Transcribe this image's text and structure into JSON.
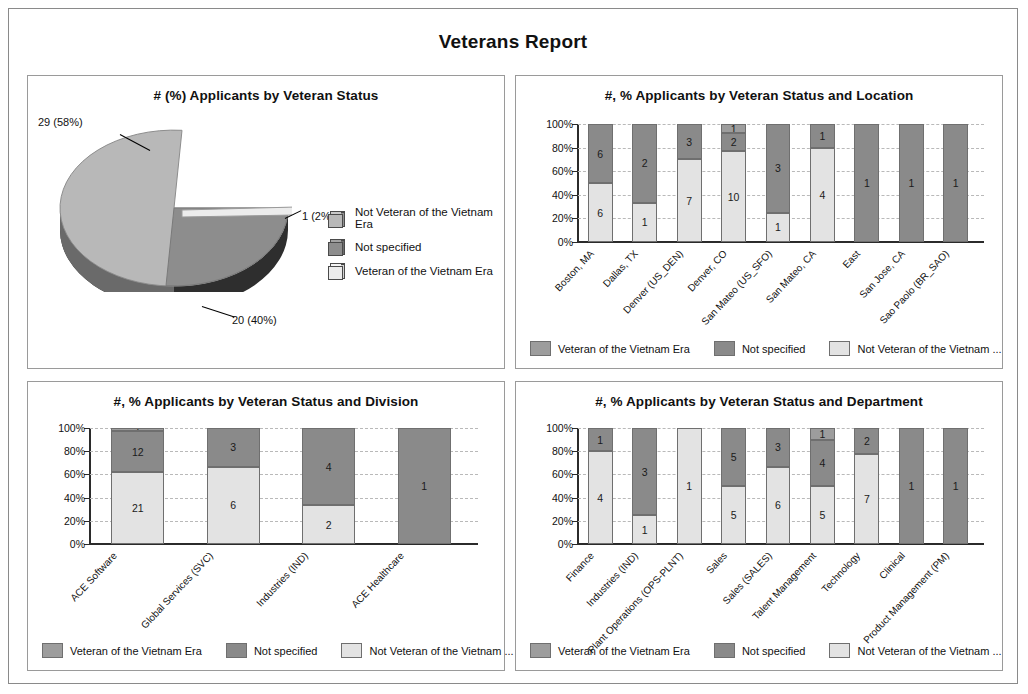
{
  "report": {
    "title": "Veterans Report"
  },
  "legend": {
    "veteran": "Veteran of the Vietnam Era",
    "not_specified": "Not specified",
    "non_veteran_short": "Not Veteran of the Vietnam ...",
    "non_veteran_full": "Not Veteran of the Vietnam Era"
  },
  "colors": {
    "veteran": "#9d9d9d",
    "not_specified": "#8a8a8a",
    "non_veteran": "#e3e3e3",
    "panel_border": "#9a9a9a",
    "axis": "#2b2b2b"
  },
  "chart_data": [
    {
      "id": "pie",
      "type": "pie",
      "title": "# (%) Applicants by Veteran Status",
      "legend_position": "right",
      "labels": [
        "Not Veteran of the Vietnam Era",
        "Not specified",
        "Veteran of the Vietnam Era"
      ],
      "slices": [
        {
          "label": "Not Veteran of the Vietnam Era",
          "value": 29,
          "percent": 58,
          "data_label": "29 (58%)"
        },
        {
          "label": "Not specified",
          "value": 20,
          "percent": 40,
          "data_label": "20 (40%)"
        },
        {
          "label": "Veteran of the Vietnam Era",
          "value": 1,
          "percent": 2,
          "data_label": "1 (2%)"
        }
      ],
      "total": 50
    },
    {
      "id": "location",
      "type": "bar",
      "stacked": true,
      "title": "#, % Applicants by Veteran Status and Location",
      "xlabel": "",
      "ylabel": "",
      "ylim": [
        0,
        100
      ],
      "yticks": [
        "0%",
        "20%",
        "40%",
        "60%",
        "80%",
        "100%"
      ],
      "grid": true,
      "legend_position": "bottom",
      "categories": [
        "Boston, MA",
        "Dallas, TX",
        "Denver (US_DEN)",
        "Denver, CO",
        "San Mateo (US_SFO)",
        "San Mateo, CA",
        "East",
        "San Jose, CA",
        "Sao Paolo (BR_SAO)"
      ],
      "series": [
        {
          "name": "Not Veteran of the Vietnam Era",
          "values": [
            6,
            1,
            7,
            10,
            1,
            4,
            0,
            0,
            0
          ]
        },
        {
          "name": "Not specified",
          "values": [
            6,
            2,
            3,
            2,
            3,
            1,
            1,
            1,
            1
          ]
        },
        {
          "name": "Veteran of the Vietnam Era",
          "values": [
            0,
            0,
            0,
            1,
            0,
            0,
            0,
            0,
            0
          ]
        }
      ]
    },
    {
      "id": "division",
      "type": "bar",
      "stacked": true,
      "title": "#, % Applicants by Veteran Status and Division",
      "xlabel": "",
      "ylabel": "",
      "ylim": [
        0,
        100
      ],
      "yticks": [
        "0%",
        "20%",
        "40%",
        "60%",
        "80%",
        "100%"
      ],
      "grid": true,
      "legend_position": "bottom",
      "categories": [
        "ACE Software",
        "Global Services (SVC)",
        "Industries (IND)",
        "ACE Healthcare"
      ],
      "series": [
        {
          "name": "Not Veteran of the Vietnam Era",
          "values": [
            21,
            6,
            2,
            0
          ]
        },
        {
          "name": "Not specified",
          "values": [
            12,
            3,
            4,
            1
          ]
        },
        {
          "name": "Veteran of the Vietnam Era",
          "values": [
            1,
            0,
            0,
            0
          ]
        }
      ]
    },
    {
      "id": "department",
      "type": "bar",
      "stacked": true,
      "title": "#, % Applicants by Veteran Status and Department",
      "xlabel": "",
      "ylabel": "",
      "ylim": [
        0,
        100
      ],
      "yticks": [
        "0%",
        "20%",
        "40%",
        "60%",
        "80%",
        "100%"
      ],
      "grid": true,
      "legend_position": "bottom",
      "categories": [
        "Finance",
        "Industries (IND)",
        "Plant Operations (OPS-PLNT)",
        "Sales",
        "Sales (SALES)",
        "Talent Management",
        "Technology",
        "Clinical",
        "Product Management (PM)"
      ],
      "series": [
        {
          "name": "Not Veteran of the Vietnam Era",
          "values": [
            4,
            1,
            1,
            5,
            6,
            5,
            7,
            0,
            0
          ]
        },
        {
          "name": "Not specified",
          "values": [
            1,
            3,
            0,
            5,
            3,
            4,
            2,
            1,
            1
          ]
        },
        {
          "name": "Veteran of the Vietnam Era",
          "values": [
            0,
            0,
            0,
            0,
            0,
            1,
            0,
            0,
            0
          ]
        }
      ]
    }
  ]
}
